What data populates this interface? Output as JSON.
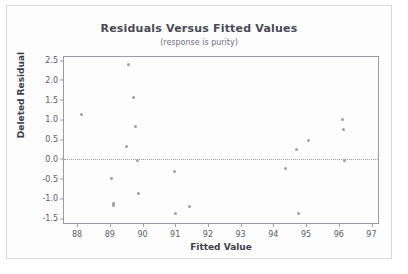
{
  "chart_data": {
    "type": "scatter",
    "title": "Residuals Versus Fitted Values",
    "subtitle": "(response is purity)",
    "xlabel": "Fitted Value",
    "ylabel": "Deleted Residual",
    "xlim": [
      87.6,
      97.2
    ],
    "ylim": [
      -1.62,
      2.58
    ],
    "xticks": [
      88,
      89,
      90,
      91,
      92,
      93,
      94,
      95,
      96,
      97
    ],
    "xtick_labels": [
      "88",
      "89",
      "90",
      "91",
      "92",
      "93",
      "94",
      "95",
      "96",
      "97"
    ],
    "yticks": [
      -1.5,
      -1.0,
      -0.5,
      0.0,
      0.5,
      1.0,
      1.5,
      2.0,
      2.5
    ],
    "ytick_labels": [
      "-1.5",
      "-1.0",
      "-0.5",
      "0.0",
      "0.5",
      "1.0",
      "1.5",
      "2.0",
      "2.5"
    ],
    "grid": false,
    "reference_line": {
      "axis": "y",
      "value": 0.0,
      "style": "dotted"
    },
    "legend": null,
    "marker_color": "#8d8d99",
    "points": [
      {
        "x": 88.15,
        "y": 1.13
      },
      {
        "x": 89.05,
        "y": -0.5
      },
      {
        "x": 89.1,
        "y": -1.12
      },
      {
        "x": 89.12,
        "y": -1.18
      },
      {
        "x": 89.5,
        "y": 0.32
      },
      {
        "x": 89.58,
        "y": 2.39
      },
      {
        "x": 89.72,
        "y": 1.56
      },
      {
        "x": 89.78,
        "y": 0.81
      },
      {
        "x": 89.85,
        "y": -0.03
      },
      {
        "x": 89.88,
        "y": -0.88
      },
      {
        "x": 90.98,
        "y": -0.32
      },
      {
        "x": 91.02,
        "y": -1.38
      },
      {
        "x": 91.45,
        "y": -1.2
      },
      {
        "x": 94.38,
        "y": -0.23
      },
      {
        "x": 94.72,
        "y": 0.23
      },
      {
        "x": 94.78,
        "y": -1.38
      },
      {
        "x": 95.08,
        "y": 0.46
      },
      {
        "x": 96.12,
        "y": 0.99
      },
      {
        "x": 96.15,
        "y": 0.75
      },
      {
        "x": 96.18,
        "y": -0.05
      }
    ]
  }
}
